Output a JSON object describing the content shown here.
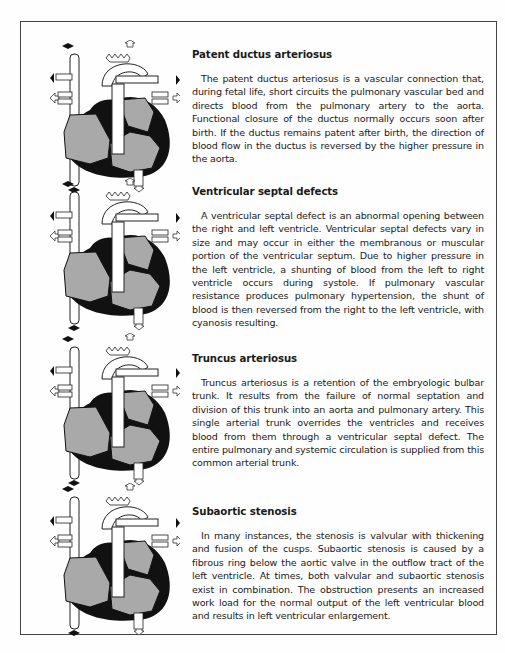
{
  "sections": [
    {
      "title": "Patent ductus arteriosus",
      "body": "The patent ductus arteriosus is a vascular connection that, during fetal life, short circuits the pulmonary vascular bed and directs blood from the pulmonary artery to the aorta. Functional closure of the ductus normally occurs soon after birth. If the ductus remains patent after birth, the direction of blood flow in the ductus is reversed by the higher pressure in the aorta.",
      "illustration": "heart-diagram-patent-ductus-arteriosus"
    },
    {
      "title": "Ventricular septal defects",
      "body": "A ventricular septal defect is an abnormal opening between the right and left ventricle. Ventricular septal defects vary in size and may occur in either the membranous or muscular portion of the ventricular septum. Due to higher pressure in the left ventricle, a shunting of blood from the left to right ventricle occurs during systole. If pulmonary vascular resistance produces pulmonary hypertension, the shunt of blood is then reversed from the right to the left ventricle, with cyanosis resulting.",
      "illustration": "heart-diagram-ventricular-septal-defect"
    },
    {
      "title": "Truncus arteriosus",
      "body": "Truncus arteriosus is a retention of the embryologic bulbar trunk. It results from the failure of normal septation and division of this trunk into an aorta and pulmonary artery. This single arterial trunk overrides the ventricles and receives blood from them through a ventricular septal defect. The entire pulmonary and systemic circulation is supplied from this common arterial trunk.",
      "illustration": "heart-diagram-truncus-arteriosus"
    },
    {
      "title": "Subaortic stenosis",
      "body": "In many instances, the stenosis is valvular with thickening and fusion of the cusps. Subaortic stenosis is caused by a fibrous ring below the aortic valve in the outflow tract of the left ventricle. At times, both valvular and subaortic stenosis exist in combination. The obstruction presents an increased work load for the normal output of the left ventricular blood and results in left ventricular enlargement.",
      "illustration": "heart-diagram-subaortic-stenosis"
    }
  ],
  "colors": {
    "heart_fill": "#a9a9a9",
    "heart_outline": "#111111",
    "vessel_fill": "#ffffff",
    "frame": "#444444"
  }
}
